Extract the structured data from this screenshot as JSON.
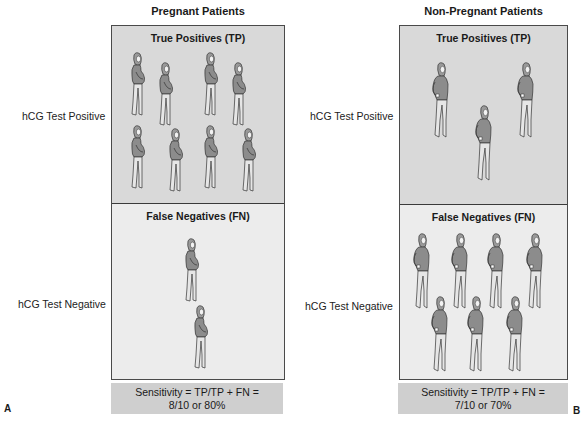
{
  "panels": [
    {
      "letter": "A",
      "title": "Pregnant Patients",
      "figure_type": "pregnant-woman",
      "tp": {
        "title": "True Positives (TP)",
        "row_label": "hCG Test Positive",
        "count": 8
      },
      "fn": {
        "title": "False Negatives (FN)",
        "row_label": "hCG Test Negative",
        "count": 2
      },
      "sensitivity": {
        "line1": "Sensitivity = TP/TP + FN =",
        "line2": "8/10 or 80%"
      }
    },
    {
      "letter": "B",
      "title": "Non-Pregnant Patients",
      "figure_type": "non-pregnant-woman",
      "tp": {
        "title": "True Positives (TP)",
        "row_label": "hCG Test Positive",
        "count": 3
      },
      "fn": {
        "title": "False Negatives (FN)",
        "row_label": "hCG Test Negative",
        "count": 7
      },
      "sensitivity": {
        "line1": "Sensitivity = TP/TP + FN =",
        "line2": "7/10 or 70%"
      }
    }
  ],
  "colors": {
    "tp_fill": "#d9d9d9",
    "fn_fill": "#ececec",
    "sensitivity_fill": "#cfcfcf",
    "border": "#4a4a4a"
  }
}
